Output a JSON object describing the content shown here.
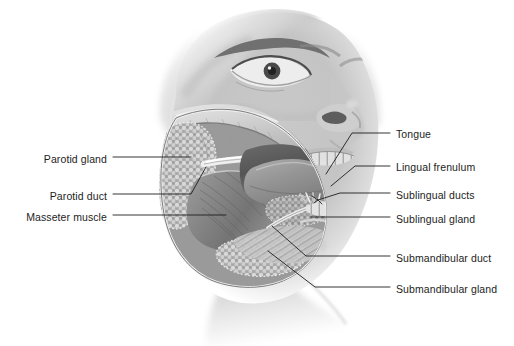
{
  "figure": {
    "background_color": "#ffffff",
    "label_color": "#1d1d1d",
    "leader_color": "#1d1d1d",
    "width": 514,
    "height": 346
  },
  "labels_left": [
    {
      "id": "parotid-gland",
      "text": "Parotid gland",
      "text_x": 107,
      "text_y": 153,
      "leader": "M113,157 L191,157"
    },
    {
      "id": "parotid-duct",
      "text": "Parotid duct",
      "text_x": 107,
      "text_y": 190,
      "leader": "M113,194 L191,194 L206,167"
    },
    {
      "id": "masseter-muscle",
      "text": "Masseter muscle",
      "text_x": 107,
      "text_y": 211,
      "leader": "M113,215 L226,215"
    }
  ],
  "labels_right": [
    {
      "id": "tongue",
      "text": "Tongue",
      "text_x": 396,
      "text_y": 128,
      "leader": "M390,133 L352,133 L326,174"
    },
    {
      "id": "lingual-frenulum",
      "text": "Lingual frenulum",
      "text_x": 396,
      "text_y": 161,
      "leader": "M390,166 L355,166 L331,186"
    },
    {
      "id": "sublingual-ducts",
      "text": "Sublingual ducts",
      "text_x": 396,
      "text_y": 189,
      "leader": "M390,193 L340,193 L318,200 M318,200 L312,196 M318,200 L314,203 M318,200 L322,204"
    },
    {
      "id": "sublingual-gland",
      "text": "Sublingual gland",
      "text_x": 396,
      "text_y": 213,
      "leader": "M390,217 L311,217"
    },
    {
      "id": "submandibular-duct",
      "text": "Submandibular duct",
      "text_x": 396,
      "text_y": 252,
      "leader": "M390,256 L306,256 L272,226"
    },
    {
      "id": "submandibular-gland",
      "text": "Submandibular gland",
      "text_x": 396,
      "text_y": 283,
      "leader": "M390,287 L315,287 L268,251"
    }
  ]
}
